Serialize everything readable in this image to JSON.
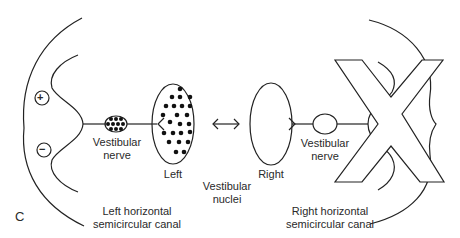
{
  "diagram": {
    "panel_label": "C",
    "left": {
      "canal_label_line1": "Left horizontal",
      "canal_label_line2": "semicircular canal",
      "plus_symbol": "+",
      "minus_symbol": "−",
      "nerve_label_line1": "Vestibular",
      "nerve_label_line2": "nerve",
      "nucleus_label": "Left"
    },
    "center": {
      "nuclei_label_line1": "Vestibular",
      "nuclei_label_line2": "nuclei",
      "connection_icon": "double-arrow"
    },
    "right": {
      "canal_label_line1": "Right horizontal",
      "canal_label_line2": "semicircular canal",
      "nerve_label_line1": "Vestibular",
      "nerve_label_line2": "nerve",
      "nucleus_label": "Right",
      "crossed_out": true
    },
    "colors": {
      "stroke": "#222222",
      "background": "#ffffff"
    }
  }
}
